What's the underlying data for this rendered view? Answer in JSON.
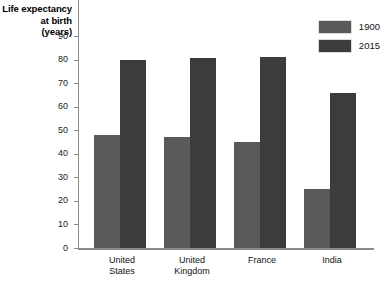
{
  "chart_data": {
    "type": "bar",
    "title": "",
    "xlabel": "",
    "ylabel": "Life expectancy at birth (years)",
    "ylim": [
      0,
      90
    ],
    "ytick_step": 10,
    "yticks": [
      90,
      80,
      70,
      60,
      50,
      40,
      30,
      20,
      10,
      0
    ],
    "grid": false,
    "legend_position": "top-right",
    "categories": [
      "United States",
      "United Kingdom",
      "France",
      "India"
    ],
    "series": [
      {
        "name": "1900",
        "color": "#5a5a5a",
        "values": [
          48,
          47,
          45,
          25
        ]
      },
      {
        "name": "2015",
        "color": "#3c3c3c",
        "values": [
          80,
          80.5,
          81,
          66
        ]
      }
    ]
  },
  "axis_title": {
    "line1": "Life expectancy",
    "line2": "at birth",
    "line3": "(years)"
  },
  "category_labels": [
    {
      "line1": "United",
      "line2": "States"
    },
    {
      "line1": "United",
      "line2": "Kingdom"
    },
    {
      "line1": "France",
      "line2": ""
    },
    {
      "line1": "India",
      "line2": ""
    }
  ],
  "ytick_labels": [
    "90",
    "80",
    "70",
    "60",
    "50",
    "40",
    "30",
    "20",
    "10",
    "0"
  ],
  "legend": [
    {
      "label": "1900"
    },
    {
      "label": "2015"
    }
  ]
}
